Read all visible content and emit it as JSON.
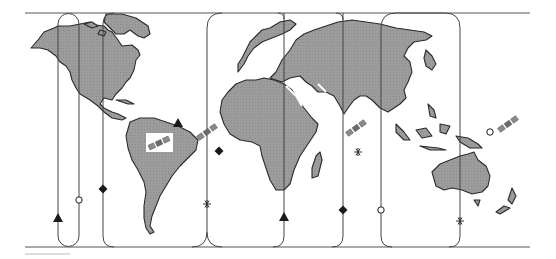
{
  "map": {
    "type": "world-satellite-coverage",
    "colors": {
      "background": "#ffffff",
      "land": "#9c9c9c",
      "land_outline": "#2a2a2a",
      "frame_lines": "#555555",
      "coverage_lines": "#444444",
      "marker": "#1a1a1a",
      "satellite": "#8a8a8a"
    },
    "frame": {
      "top_y": 13,
      "bottom_y": 247,
      "x_start": 25,
      "x_end": 530
    },
    "coverage_regions": [
      {
        "id": "region-1",
        "left_x": 58,
        "right_x": 79,
        "marker_left": "triangle",
        "marker_right": "circle"
      },
      {
        "id": "region-2",
        "left_x": 103,
        "right_x": 207,
        "marker_left": "diamond",
        "marker_right": "asterisk"
      },
      {
        "id": "region-3",
        "left_x": 207,
        "right_x": 343,
        "marker_left": "asterisk",
        "marker_right": "diamond"
      },
      {
        "id": "region-4",
        "left_x": 381,
        "right_x": 460,
        "marker_left": "circle",
        "marker_right": "asterisk"
      }
    ],
    "markers": [
      {
        "symbol": "triangle",
        "x": 58,
        "y": 218
      },
      {
        "symbol": "circle",
        "x": 79,
        "y": 200
      },
      {
        "symbol": "diamond",
        "x": 103,
        "y": 189
      },
      {
        "symbol": "triangle",
        "x": 178,
        "y": 123
      },
      {
        "symbol": "diamond",
        "x": 219,
        "y": 151
      },
      {
        "symbol": "asterisk",
        "x": 207,
        "y": 204
      },
      {
        "symbol": "triangle",
        "x": 284,
        "y": 217
      },
      {
        "symbol": "diamond",
        "x": 343,
        "y": 210
      },
      {
        "symbol": "asterisk",
        "x": 358,
        "y": 152
      },
      {
        "symbol": "circle",
        "x": 381,
        "y": 210
      },
      {
        "symbol": "circle",
        "x": 490,
        "y": 132
      },
      {
        "symbol": "asterisk",
        "x": 460,
        "y": 221
      }
    ],
    "satellites": [
      {
        "id": "sat-atlantic-west",
        "x": 159,
        "y": 143,
        "angle": -25
      },
      {
        "id": "sat-atlantic-east",
        "x": 207,
        "y": 132,
        "angle": -35
      },
      {
        "id": "sat-indian",
        "x": 356,
        "y": 128,
        "angle": -35
      },
      {
        "id": "sat-pacific",
        "x": 508,
        "y": 124,
        "angle": -35
      }
    ],
    "legend_symbols": [
      "▲",
      "○",
      "◆",
      "✱"
    ]
  }
}
